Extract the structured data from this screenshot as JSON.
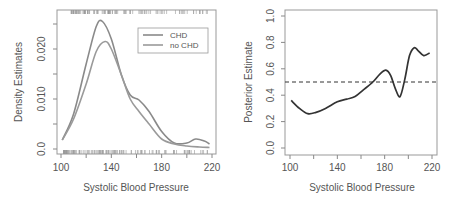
{
  "chart_data": [
    {
      "type": "line",
      "title": "",
      "xlabel": "Systolic Blood Pressure",
      "ylabel": "Density Estimates",
      "xlim": [
        100,
        220
      ],
      "ylim": [
        0,
        0.027
      ],
      "xticks": [
        "100",
        "140",
        "180",
        "220"
      ],
      "yticks": [
        "0.0",
        "0.010",
        "0.020"
      ],
      "grid": false,
      "legend": {
        "position": "top-right",
        "entries": [
          "CHD",
          "no CHD"
        ]
      },
      "rug": {
        "top": "CHD observations",
        "bottom": "no CHD observations"
      },
      "series": [
        {
          "name": "CHD",
          "x": [
            101,
            110,
            120,
            128,
            133,
            140,
            148,
            155,
            162,
            170,
            180,
            190,
            200,
            207,
            214,
            218
          ],
          "y": [
            0.0018,
            0.007,
            0.017,
            0.0245,
            0.0255,
            0.022,
            0.0148,
            0.0108,
            0.0098,
            0.0075,
            0.0035,
            0.0012,
            0.0012,
            0.002,
            0.0016,
            0.001
          ]
        },
        {
          "name": "no CHD",
          "x": [
            101,
            110,
            120,
            128,
            135,
            140,
            148,
            155,
            162,
            170,
            180,
            190,
            200,
            210,
            218
          ],
          "y": [
            0.0018,
            0.006,
            0.013,
            0.0195,
            0.0215,
            0.02,
            0.0148,
            0.01,
            0.0075,
            0.005,
            0.002,
            0.001,
            0.0006,
            0.0004,
            0.0003
          ]
        }
      ]
    },
    {
      "type": "line",
      "title": "",
      "xlabel": "Systolic Blood Pressure",
      "ylabel": "Posterior Estimate",
      "xlim": [
        100,
        220
      ],
      "ylim": [
        0.0,
        1.0
      ],
      "xticks": [
        "100",
        "140",
        "180",
        "220"
      ],
      "yticks": [
        "0.0",
        "0.2",
        "0.4",
        "0.6",
        "0.8",
        "1.0"
      ],
      "grid": false,
      "reference_line": {
        "y": 0.5,
        "style": "dashed"
      },
      "series": [
        {
          "name": "Posterior",
          "x": [
            101,
            108,
            115,
            122,
            130,
            140,
            148,
            155,
            162,
            170,
            176,
            181,
            185,
            189,
            193,
            197,
            201,
            205,
            208,
            213,
            218
          ],
          "y": [
            0.36,
            0.3,
            0.26,
            0.27,
            0.3,
            0.35,
            0.37,
            0.39,
            0.44,
            0.5,
            0.56,
            0.59,
            0.55,
            0.45,
            0.39,
            0.52,
            0.7,
            0.76,
            0.74,
            0.7,
            0.72
          ]
        }
      ]
    }
  ],
  "panels": {
    "left": {
      "xlabel": "Systolic Blood Pressure",
      "ylabel": "Density Estimates",
      "xticks": [
        "100",
        "140",
        "180",
        "220"
      ],
      "yticks": [
        "0.0",
        "0.010",
        "0.020"
      ],
      "legend": [
        "CHD",
        "no CHD"
      ]
    },
    "right": {
      "xlabel": "Systolic Blood Pressure",
      "ylabel": "Posterior Estimate",
      "xticks": [
        "100",
        "140",
        "180",
        "220"
      ],
      "yticks": [
        "0.0",
        "0.2",
        "0.4",
        "0.6",
        "0.8",
        "1.0"
      ]
    }
  },
  "colors": {
    "curve": "#8a8a8a",
    "posterior": "#333333",
    "axis": "#888888",
    "text": "#555555"
  }
}
